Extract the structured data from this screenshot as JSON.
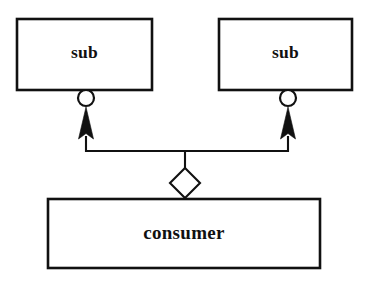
{
  "diagram": {
    "type": "uml-component-diagram",
    "background_color": "#ffffff",
    "stroke_color": "#111111",
    "fill_color": "#ffffff",
    "nodes": [
      {
        "id": "sub-left",
        "label": "sub",
        "shape": "rectangle",
        "x": 17,
        "y": 19,
        "width": 135,
        "height": 71
      },
      {
        "id": "sub-right",
        "label": "sub",
        "shape": "rectangle",
        "x": 219,
        "y": 19,
        "width": 133,
        "height": 71
      },
      {
        "id": "consumer",
        "label": "consumer",
        "shape": "rectangle",
        "x": 48,
        "y": 199,
        "width": 272,
        "height": 69
      }
    ],
    "connectors": [
      {
        "id": "socket-left",
        "kind": "socket-circle",
        "cx": 86,
        "cy": 98,
        "r": 8
      },
      {
        "id": "socket-right",
        "kind": "socket-circle",
        "cx": 288,
        "cy": 98,
        "r": 8
      },
      {
        "id": "arrow-left",
        "kind": "filled-arrowhead-up",
        "tip_x": 86,
        "tip_y": 108,
        "base_y": 139,
        "half_width": 8
      },
      {
        "id": "arrow-right",
        "kind": "filled-arrowhead-up",
        "tip_x": 288,
        "tip_y": 108,
        "base_y": 139,
        "half_width": 8
      },
      {
        "id": "aggregation-diamond",
        "kind": "diamond-hollow",
        "cx": 185,
        "cy": 183,
        "half_width": 15,
        "half_height": 15
      },
      {
        "id": "bus-line",
        "kind": "orthogonal-bus",
        "horizontal_y": 151,
        "left_x": 86,
        "right_x": 288,
        "stem_x": 185,
        "stem_top_y": 151,
        "stem_bottom_y": 168,
        "diamond_to_box_y": 199
      }
    ]
  }
}
